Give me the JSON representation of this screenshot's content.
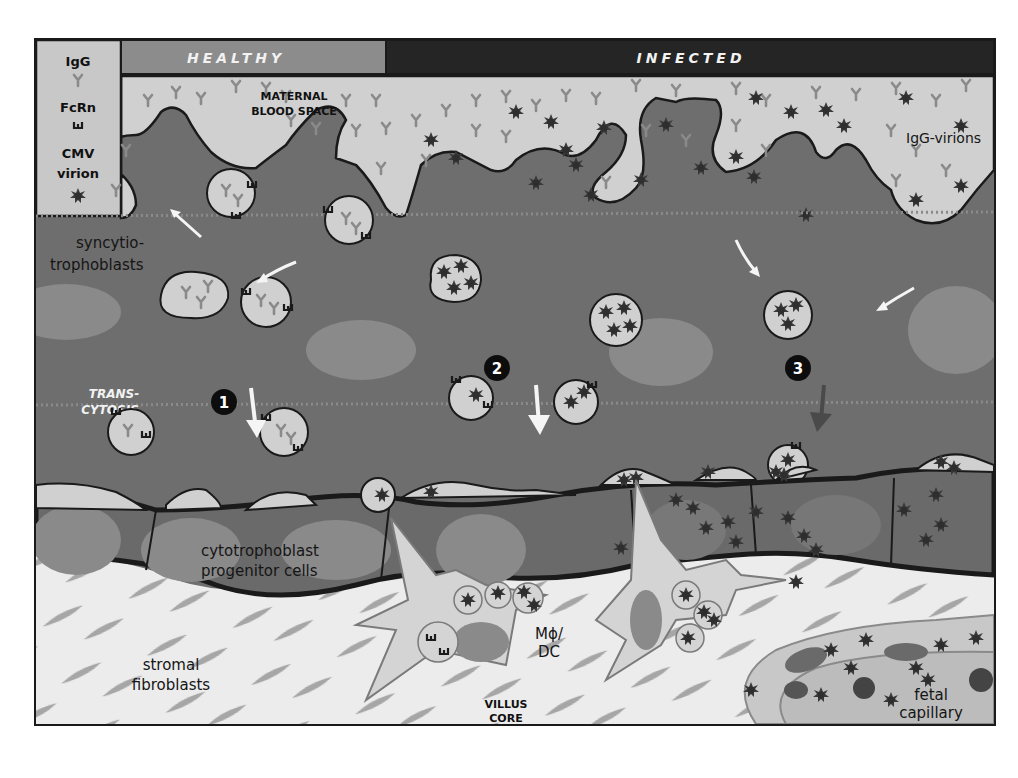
{
  "header": {
    "healthy_label": "HEALTHY",
    "infected_label": "INFECTED"
  },
  "legend": {
    "items": [
      {
        "label": "IgG",
        "icon": "igg-y-icon"
      },
      {
        "label": "FcRn",
        "icon": "fcrn-receptor-icon"
      },
      {
        "label": "CMV virion",
        "label_line1": "CMV",
        "label_line2": "virion",
        "icon": "virion-star-icon"
      }
    ]
  },
  "labels": {
    "maternal_blood_space_1": "MATERNAL",
    "maternal_blood_space_2": "BLOOD SPACE",
    "igg_virions": "IgG-virions",
    "syncytiotrophoblasts_1": "syncytio-",
    "syncytiotrophoblasts_2": "trophoblasts",
    "transcytosis_1": "TRANS-",
    "transcytosis_2": "CYTOSIS",
    "cytotrophoblast_1": "cytotrophoblast",
    "cytotrophoblast_2": "progenitor cells",
    "stromal_1": "stromal",
    "stromal_2": "fibroblasts",
    "macrophage_1": "Mϕ/",
    "macrophage_2": "DC",
    "villus_core_1": "VILLUS",
    "villus_core_2": "CORE",
    "fetal_capillary_1": "fetal",
    "fetal_capillary_2": "capillary"
  },
  "steps": [
    {
      "number": "1",
      "arrow": "white"
    },
    {
      "number": "2",
      "arrow": "white"
    },
    {
      "number": "3",
      "arrow": "dark"
    }
  ],
  "colors": {
    "healthy_band": "#8c8c8c",
    "infected_band": "#252525",
    "syncytium": "#6e6e6e",
    "blood_space": "#cfcfcf",
    "nucleus": "#8a8a8a",
    "stroma": "#ececec",
    "fibroblast": "#9a9a9a",
    "virion": "#3a3a3a",
    "igg": "#8a8a8a",
    "outline": "#1a1a1a"
  }
}
